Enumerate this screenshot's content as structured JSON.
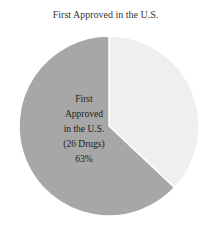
{
  "chart_data": {
    "type": "pie",
    "title": "First Approved in the U.S.",
    "slices": [
      {
        "label": "First Approved in the U.S. (26 Drugs)",
        "value": 63,
        "color": "#a7a7a7",
        "label_lines": [
          "First",
          "Approved",
          "in the U.S.",
          "(26 Drugs)",
          "63%"
        ]
      },
      {
        "label": "",
        "value": 37,
        "color": "#efefef"
      }
    ],
    "start_angle_deg": 0,
    "direction": "clockwise",
    "legend": "none"
  }
}
